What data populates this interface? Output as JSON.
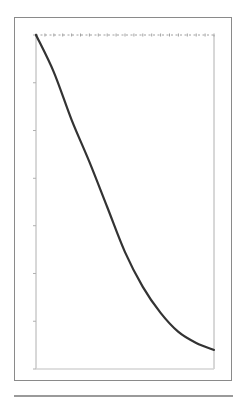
{
  "chart_data": {
    "type": "line",
    "title": "",
    "xlabel": "",
    "ylabel": "",
    "xlim": [
      0,
      20
    ],
    "ylim": [
      0,
      1
    ],
    "grid": false,
    "legend": null,
    "x": [
      0,
      2,
      4,
      6,
      8,
      10,
      12,
      14,
      16,
      18,
      20
    ],
    "series": [
      {
        "name": "curve",
        "color": "#333333",
        "values": [
          1.0,
          0.889,
          0.746,
          0.62,
          0.485,
          0.35,
          0.246,
          0.168,
          0.111,
          0.078,
          0.057
        ]
      },
      {
        "name": "reference",
        "color": "#999999",
        "style": "dashed",
        "values": [
          1.0,
          1.0,
          1.0,
          1.0,
          1.0,
          1.0,
          1.0,
          1.0,
          1.0,
          1.0,
          1.0
        ]
      }
    ],
    "y_ticks": [
      0,
      0.143,
      0.286,
      0.429,
      0.571,
      0.714,
      0.857,
      1.0
    ],
    "x_marker_count": 21
  },
  "colors": {
    "frame": "#8a8a8a",
    "axis": "#b0b0b0",
    "curve": "#333333",
    "reference": "#a0a0a0"
  }
}
